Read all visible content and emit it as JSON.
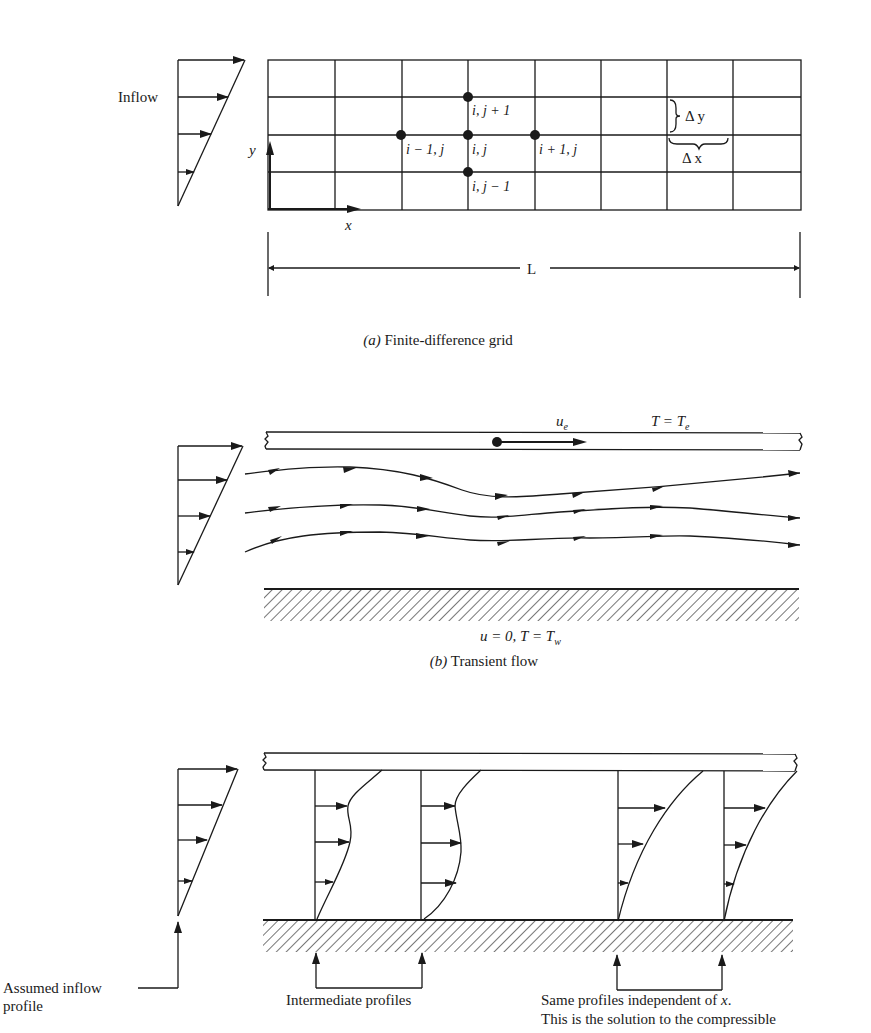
{
  "figure": {
    "panel_a": {
      "caption_letter": "(a)",
      "caption_text": " Finite-difference grid",
      "inflow_label": "Inflow",
      "axis_y": "y",
      "axis_x": "x",
      "length_label": "L",
      "delta_y": "Δ y",
      "delta_x": "Δ x",
      "grid": {
        "columns": 8,
        "rows": 4
      },
      "nodes": [
        {
          "id": "i-1,j",
          "label": "i − 1, j"
        },
        {
          "id": "i,j",
          "label": "i, j"
        },
        {
          "id": "i+1,j",
          "label": "i + 1, j"
        },
        {
          "id": "i,j+1",
          "label": "i, j + 1"
        },
        {
          "id": "i,j-1",
          "label": "i, j − 1"
        }
      ]
    },
    "panel_b": {
      "caption_letter": "(b)",
      "caption_text": " Transient flow",
      "edge_velocity_label": "u",
      "edge_velocity_sub": "e",
      "edge_temp_label": "T = T",
      "edge_temp_sub": "e",
      "wall_condition": "u = 0, T = T",
      "wall_condition_sub": "w",
      "streamline_count": 3
    },
    "panel_c": {
      "assumed_inflow_line1": "Assumed inflow",
      "assumed_inflow_line2": "profile",
      "intermediate_label": "Intermediate profiles",
      "same_profiles_line1": "Same profiles independent of x.",
      "same_profiles_line2": "This is the solution to the compressible"
    }
  }
}
